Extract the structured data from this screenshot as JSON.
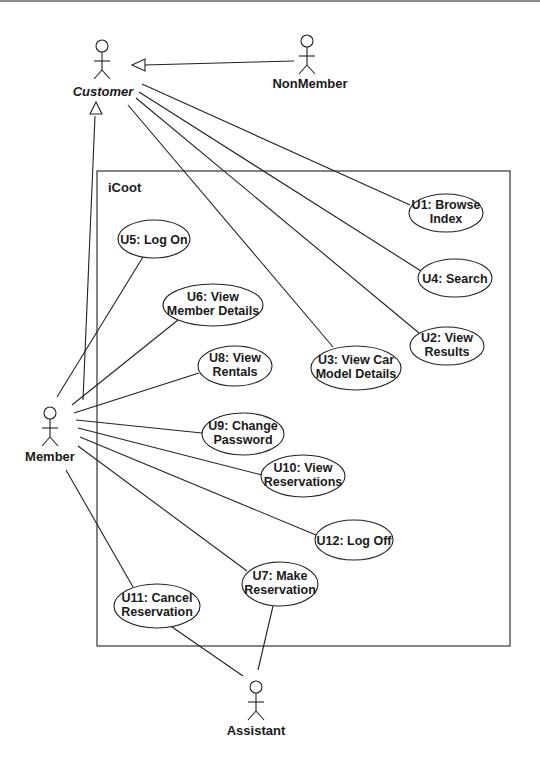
{
  "diagram": {
    "type": "uml-use-case",
    "system": {
      "label": "iCoot",
      "x": 97,
      "y": 171,
      "w": 413,
      "h": 475
    },
    "actors": [
      {
        "id": "customer",
        "label": "Customer",
        "abstract": true,
        "x": 102,
        "y": 40
      },
      {
        "id": "nonmember",
        "label": "NonMember",
        "abstract": false,
        "x": 306,
        "y": 34
      },
      {
        "id": "member",
        "label": "Member",
        "abstract": false,
        "x": 50,
        "y": 408
      },
      {
        "id": "assistant",
        "label": "Assistant",
        "abstract": false,
        "x": 256,
        "y": 681
      }
    ],
    "use_cases": [
      {
        "id": "U1",
        "line1": "U1: Browse",
        "line2": "Index",
        "cx": 446,
        "cy": 213,
        "rx": 37,
        "ry": 19
      },
      {
        "id": "U4",
        "line1": "U4: Search",
        "line2": "",
        "cx": 455,
        "cy": 278,
        "rx": 37,
        "ry": 19
      },
      {
        "id": "U2",
        "line1": "U2: View",
        "line2": "Results",
        "cx": 447,
        "cy": 346,
        "rx": 37,
        "ry": 19
      },
      {
        "id": "U3",
        "line1": "U3: View Car",
        "line2": "Model Details",
        "cx": 356,
        "cy": 368,
        "rx": 45,
        "ry": 22
      },
      {
        "id": "U5",
        "line1": "U5: Log On",
        "line2": "",
        "cx": 154,
        "cy": 239,
        "rx": 36,
        "ry": 19
      },
      {
        "id": "U6",
        "line1": "U6: View",
        "line2": "Member Details",
        "cx": 213,
        "cy": 305,
        "rx": 50,
        "ry": 21
      },
      {
        "id": "U8",
        "line1": "U8: View",
        "line2": "Rentals",
        "cx": 235,
        "cy": 366,
        "rx": 37,
        "ry": 20
      },
      {
        "id": "U9",
        "line1": "U9: Change",
        "line2": "Password",
        "cx": 243,
        "cy": 434,
        "rx": 41,
        "ry": 21
      },
      {
        "id": "U10",
        "line1": "U10: View",
        "line2": "Reservations",
        "cx": 303,
        "cy": 476,
        "rx": 42,
        "ry": 21
      },
      {
        "id": "U12",
        "line1": "U12: Log Off",
        "line2": "",
        "cx": 354,
        "cy": 540,
        "rx": 39,
        "ry": 20
      },
      {
        "id": "U7",
        "line1": "U7: Make",
        "line2": "Reservation",
        "cx": 280,
        "cy": 584,
        "rx": 38,
        "ry": 22
      },
      {
        "id": "U11",
        "line1": "U11: Cancel",
        "line2": "Reservation",
        "cx": 157,
        "cy": 606,
        "rx": 43,
        "ry": 22
      }
    ],
    "generalizations": [
      {
        "from": "nonmember",
        "to": "customer"
      },
      {
        "from": "member",
        "to": "customer"
      }
    ],
    "associations": [
      {
        "actor": "customer",
        "use_case": "U1"
      },
      {
        "actor": "customer",
        "use_case": "U4"
      },
      {
        "actor": "customer",
        "use_case": "U2"
      },
      {
        "actor": "customer",
        "use_case": "U3"
      },
      {
        "actor": "member",
        "use_case": "U5"
      },
      {
        "actor": "member",
        "use_case": "U6"
      },
      {
        "actor": "member",
        "use_case": "U8"
      },
      {
        "actor": "member",
        "use_case": "U9"
      },
      {
        "actor": "member",
        "use_case": "U10"
      },
      {
        "actor": "member",
        "use_case": "U12"
      },
      {
        "actor": "member",
        "use_case": "U7"
      },
      {
        "actor": "member",
        "use_case": "U11"
      },
      {
        "actor": "assistant",
        "use_case": "U7"
      },
      {
        "actor": "assistant",
        "use_case": "U11"
      }
    ]
  }
}
